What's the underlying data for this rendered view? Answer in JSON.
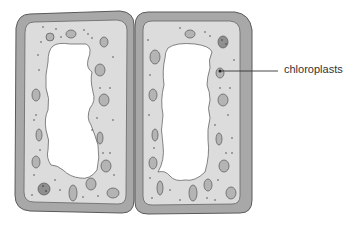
{
  "diagram": {
    "labels": [
      {
        "id": "chloroplasts",
        "text": "chloroplasts",
        "x": 287,
        "y": 74
      }
    ]
  },
  "colors": {
    "cell_wall": "#a8a8a8",
    "cell_wall_stroke": "#5a5a5a",
    "cytoplasm": "#dcdcdc",
    "cytoplasm_inner": "#e4e4e4",
    "vacuole": "#ffffff",
    "chloroplast": "#b4b4b4",
    "chloroplast_dark": "#8f8f8f",
    "stroke": "#555555",
    "dot": "#333333"
  }
}
